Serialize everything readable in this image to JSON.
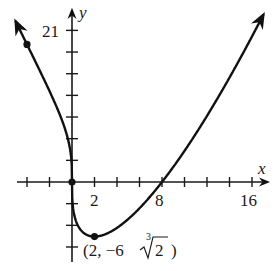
{
  "chart_data": {
    "type": "line",
    "title": "",
    "function": "f(x) = x^(1/3) (x - 8)",
    "xlabel": "x",
    "ylabel": "y",
    "xlim": [
      -6.4,
      18
    ],
    "ylim": [
      -11.5,
      25
    ],
    "x_ticks_step": 2,
    "y_ticks_step": 3,
    "x_tick_labels": [
      {
        "value": 2,
        "label": "2"
      },
      {
        "value": 8,
        "label": "8"
      },
      {
        "value": 16,
        "label": "16"
      }
    ],
    "y_tick_labels": [
      {
        "value": 21,
        "label": "21"
      }
    ],
    "grid": false,
    "legend": null,
    "series": [
      {
        "name": "f",
        "x_range": [
          -5,
          17
        ],
        "arrow_ends": true
      }
    ],
    "marked_points": [
      {
        "x": -4,
        "y": 19.05,
        "label": ""
      },
      {
        "x": 0,
        "y": 0,
        "label": ""
      },
      {
        "x": 2,
        "y": -7.56,
        "label": "(2, −6∛2)"
      }
    ],
    "annotations": [
      {
        "text": "(2, −6",
        "root_index": "3",
        "root_radicand": "2",
        "close": ")",
        "near_point": [
          2,
          -7.56
        ]
      }
    ]
  },
  "labels": {
    "x_axis": "x",
    "y_axis": "y",
    "y21": "21",
    "x2": "2",
    "x8": "8",
    "x16": "16",
    "min_point_prefix": "(2, −6",
    "root_index": "3",
    "root_radicand": "2",
    "min_point_suffix": ")"
  }
}
